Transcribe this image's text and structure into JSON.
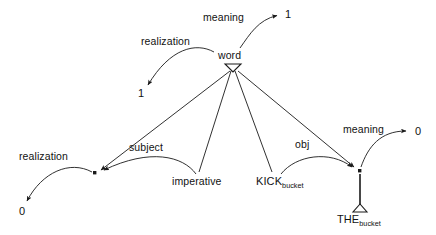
{
  "diagram": {
    "ink_color": "#1a1a1a",
    "background": "#ffffff",
    "nodes": [
      {
        "id": "word",
        "label": "word",
        "x": 232,
        "y": 56,
        "kind": "category-label"
      },
      {
        "id": "meaning_1",
        "label": "1",
        "x": 288,
        "y": 15,
        "kind": "value"
      },
      {
        "id": "realization_1",
        "label": "1",
        "x": 141,
        "y": 94,
        "kind": "value"
      },
      {
        "id": "subject_dot",
        "label": "",
        "x": 95,
        "y": 173,
        "kind": "junction-dot"
      },
      {
        "id": "realization_0",
        "label": "0",
        "x": 22,
        "y": 212,
        "kind": "value"
      },
      {
        "id": "imperative",
        "label": "imperative",
        "x": 200,
        "y": 182,
        "kind": "category-label"
      },
      {
        "id": "kick_bucket",
        "label": "KICK",
        "sub": "bucket",
        "x": 293,
        "y": 182,
        "kind": "lexeme-label"
      },
      {
        "id": "obj_dot",
        "label": "",
        "x": 359,
        "y": 171,
        "kind": "junction-dot"
      },
      {
        "id": "meaning_0",
        "label": "0",
        "x": 418,
        "y": 132,
        "kind": "value"
      },
      {
        "id": "the_bucket",
        "label": "THE",
        "sub": "bucket",
        "x": 360,
        "y": 222,
        "kind": "lexeme-label"
      }
    ],
    "edge_labels": [
      {
        "id": "meaning_top",
        "text": "meaning",
        "x": 226,
        "y": 18
      },
      {
        "id": "realization_left",
        "text": "realization",
        "x": 148,
        "y": 42
      },
      {
        "id": "subject",
        "text": "subject",
        "x": 133,
        "y": 148
      },
      {
        "id": "obj",
        "text": "obj",
        "x": 300,
        "y": 145
      },
      {
        "id": "meaning_right",
        "text": "meaning",
        "x": 345,
        "y": 131
      },
      {
        "id": "realization_bottom",
        "text": "realization",
        "x": 23,
        "y": 157
      }
    ],
    "relations": [
      {
        "from": "word",
        "to": "meaning_1",
        "label": "meaning",
        "style": "curved-arrow"
      },
      {
        "from": "word",
        "to": "realization_1",
        "label": "realization",
        "style": "curved-arrow"
      },
      {
        "from": "word",
        "to": "subject_dot",
        "label": "",
        "style": "straight-arrow"
      },
      {
        "from": "word",
        "to": "imperative",
        "label": "",
        "style": "straight"
      },
      {
        "from": "word",
        "to": "kick_bucket",
        "label": "",
        "style": "straight"
      },
      {
        "from": "word",
        "to": "obj_dot",
        "label": "",
        "style": "straight-arrow"
      },
      {
        "from": "imperative",
        "to": "subject_dot",
        "label": "subject",
        "style": "curved-arrow"
      },
      {
        "from": "kick_bucket",
        "to": "obj_dot",
        "label": "obj",
        "style": "curved-arrow"
      },
      {
        "from": "subject_dot",
        "to": "realization_0",
        "label": "realization",
        "style": "curved-arrow"
      },
      {
        "from": "obj_dot",
        "to": "meaning_0",
        "label": "meaning",
        "style": "curved-arrow"
      },
      {
        "from": "obj_dot",
        "to": "the_bucket",
        "label": "",
        "style": "stem-triangle"
      }
    ]
  }
}
